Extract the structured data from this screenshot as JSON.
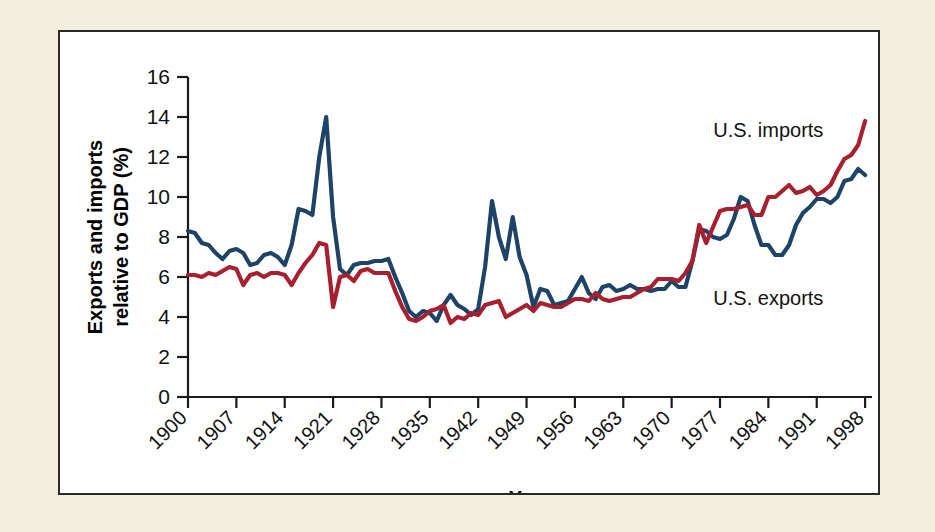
{
  "figure": {
    "background_color": "#f3efdf",
    "panel_color": "#ffffff",
    "border_color": "#2b2a26"
  },
  "chart_data": {
    "type": "line",
    "title": "",
    "xlabel": "Year",
    "ylabel": "Exports and imports relative to GDP (%)",
    "ylim": [
      0,
      16
    ],
    "xlim": [
      1900,
      1999
    ],
    "ytick_labels": [
      "0",
      "2",
      "4",
      "6",
      "8",
      "10",
      "12",
      "14",
      "16"
    ],
    "ytick_values": [
      0,
      2,
      4,
      6,
      8,
      10,
      12,
      14,
      16
    ],
    "xtick_labels": [
      "1900",
      "1907",
      "1914",
      "1921",
      "1928",
      "1935",
      "1942",
      "1949",
      "1956",
      "1963",
      "1970",
      "1977",
      "1984",
      "1991",
      "1998"
    ],
    "xtick_values": [
      1900,
      1907,
      1914,
      1921,
      1928,
      1935,
      1942,
      1949,
      1956,
      1963,
      1970,
      1977,
      1984,
      1991,
      1998
    ],
    "grid": false,
    "legend_position": "inline-annotation",
    "series": [
      {
        "name": "U.S. exports",
        "color": "#1d4367",
        "label_x": 1984,
        "label_y": 4.6,
        "x": [
          1900,
          1901,
          1902,
          1903,
          1904,
          1905,
          1906,
          1907,
          1908,
          1909,
          1910,
          1911,
          1912,
          1913,
          1914,
          1915,
          1916,
          1917,
          1918,
          1919,
          1920,
          1921,
          1922,
          1923,
          1924,
          1925,
          1926,
          1927,
          1928,
          1929,
          1930,
          1931,
          1932,
          1933,
          1934,
          1935,
          1936,
          1937,
          1938,
          1939,
          1940,
          1941,
          1942,
          1943,
          1944,
          1945,
          1946,
          1947,
          1948,
          1949,
          1950,
          1951,
          1952,
          1953,
          1954,
          1955,
          1956,
          1957,
          1958,
          1959,
          1960,
          1961,
          1962,
          1963,
          1964,
          1965,
          1966,
          1967,
          1968,
          1969,
          1970,
          1971,
          1972,
          1973,
          1974,
          1975,
          1976,
          1977,
          1978,
          1979,
          1980,
          1981,
          1982,
          1983,
          1984,
          1985,
          1986,
          1987,
          1988,
          1989,
          1990,
          1991,
          1992,
          1993,
          1994,
          1995,
          1996,
          1997,
          1998
        ],
        "values": [
          8.3,
          8.2,
          7.7,
          7.6,
          7.2,
          6.9,
          7.3,
          7.4,
          7.2,
          6.6,
          6.7,
          7.1,
          7.2,
          7.0,
          6.6,
          7.6,
          9.4,
          9.3,
          9.1,
          12.0,
          14.0,
          9.0,
          6.4,
          6.1,
          6.6,
          6.7,
          6.7,
          6.8,
          6.8,
          6.9,
          6.0,
          5.2,
          4.3,
          4.0,
          4.3,
          4.2,
          3.8,
          4.6,
          5.1,
          4.6,
          4.4,
          4.1,
          4.4,
          6.5,
          9.8,
          8.0,
          6.9,
          9.0,
          7.0,
          6.1,
          4.5,
          5.4,
          5.3,
          4.6,
          4.7,
          4.8,
          5.4,
          6.0,
          5.2,
          4.9,
          5.5,
          5.6,
          5.3,
          5.4,
          5.6,
          5.4,
          5.4,
          5.3,
          5.4,
          5.4,
          5.8,
          5.5,
          5.5,
          6.8,
          8.4,
          8.3,
          8.0,
          7.9,
          8.1,
          8.9,
          10.0,
          9.8,
          8.6,
          7.6,
          7.6,
          7.1,
          7.1,
          7.6,
          8.6,
          9.2,
          9.5,
          9.9,
          9.9,
          9.7,
          10.0,
          10.8,
          10.9,
          11.4,
          11.1
        ]
      },
      {
        "name": "U.S. imports",
        "color": "#a81f2e",
        "label_x": 1984,
        "label_y": 13.0,
        "x": [
          1900,
          1901,
          1902,
          1903,
          1904,
          1905,
          1906,
          1907,
          1908,
          1909,
          1910,
          1911,
          1912,
          1913,
          1914,
          1915,
          1916,
          1917,
          1918,
          1919,
          1920,
          1921,
          1922,
          1923,
          1924,
          1925,
          1926,
          1927,
          1928,
          1929,
          1930,
          1931,
          1932,
          1933,
          1934,
          1935,
          1936,
          1937,
          1938,
          1939,
          1940,
          1941,
          1942,
          1943,
          1944,
          1945,
          1946,
          1947,
          1948,
          1949,
          1950,
          1951,
          1952,
          1953,
          1954,
          1955,
          1956,
          1957,
          1958,
          1959,
          1960,
          1961,
          1962,
          1963,
          1964,
          1965,
          1966,
          1967,
          1968,
          1969,
          1970,
          1971,
          1972,
          1973,
          1974,
          1975,
          1976,
          1977,
          1978,
          1979,
          1980,
          1981,
          1982,
          1983,
          1984,
          1985,
          1986,
          1987,
          1988,
          1989,
          1990,
          1991,
          1992,
          1993,
          1994,
          1995,
          1996,
          1997,
          1998
        ],
        "values": [
          6.1,
          6.1,
          6.0,
          6.2,
          6.1,
          6.3,
          6.5,
          6.4,
          5.6,
          6.1,
          6.2,
          6.0,
          6.2,
          6.2,
          6.1,
          5.6,
          6.2,
          6.7,
          7.1,
          7.7,
          7.6,
          4.5,
          6.0,
          6.1,
          5.8,
          6.3,
          6.4,
          6.2,
          6.2,
          6.2,
          5.3,
          4.5,
          3.9,
          3.8,
          4.0,
          4.3,
          4.4,
          4.6,
          3.7,
          4.0,
          3.9,
          4.2,
          4.1,
          4.6,
          4.7,
          4.8,
          4.0,
          4.2,
          4.4,
          4.6,
          4.3,
          4.7,
          4.6,
          4.5,
          4.5,
          4.7,
          4.9,
          4.9,
          4.8,
          5.2,
          4.9,
          4.8,
          4.9,
          5.0,
          5.0,
          5.2,
          5.4,
          5.5,
          5.9,
          5.9,
          5.9,
          5.8,
          6.2,
          6.8,
          8.6,
          7.7,
          8.5,
          9.3,
          9.4,
          9.4,
          9.5,
          9.6,
          9.1,
          9.1,
          10.0,
          10.0,
          10.3,
          10.6,
          10.2,
          10.3,
          10.5,
          10.1,
          10.3,
          10.6,
          11.3,
          11.9,
          12.1,
          12.6,
          13.8
        ]
      }
    ]
  },
  "axis": {
    "x_title": "Year",
    "y_title_line1": "Exports and imports",
    "y_title_line2": "relative to GDP (%)"
  }
}
